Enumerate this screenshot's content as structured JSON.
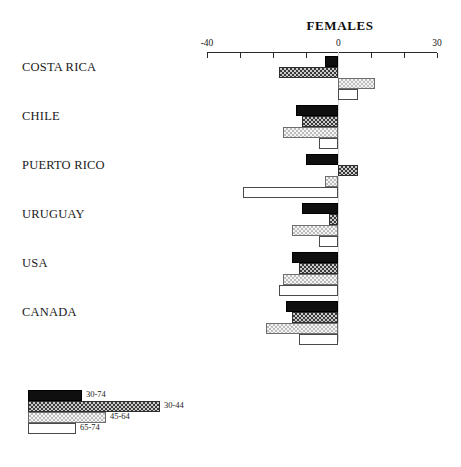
{
  "chart_data": {
    "type": "bar",
    "orientation": "horizontal",
    "title": "FEMALES",
    "xlabel": "",
    "ylabel": "",
    "xlim": [
      -40,
      30
    ],
    "xticks": [
      -40,
      -30,
      -20,
      -10,
      0,
      10,
      20,
      30
    ],
    "xtick_labels_shown": [
      "-40",
      "0",
      "30"
    ],
    "grid": false,
    "legend_position": "bottom-left",
    "categories": [
      "COSTA RICA",
      "CHILE",
      "PUERTO RICO",
      "URUGUAY",
      "USA",
      "CANADA"
    ],
    "series": [
      {
        "name": "30-74",
        "values": [
          -4,
          -13,
          -10,
          -11,
          -14,
          -16
        ]
      },
      {
        "name": "30-44",
        "values": [
          -18,
          -11,
          6,
          -3,
          -12,
          -14
        ]
      },
      {
        "name": "45-64",
        "values": [
          11,
          -17,
          -4,
          -14,
          -17,
          -22
        ]
      },
      {
        "name": "65-74",
        "values": [
          6,
          -6,
          -29,
          -6,
          -18,
          -12
        ]
      }
    ]
  },
  "title": "FEMALES",
  "axis": {
    "labels": [
      {
        "value": "-40",
        "at": -40
      },
      {
        "value": "0",
        "at": 0
      },
      {
        "value": "30",
        "at": 30
      }
    ]
  },
  "legend": {
    "items": [
      {
        "label": "30-74",
        "pattern": "solid-black",
        "swatch_width": 54
      },
      {
        "label": "30-44",
        "pattern": "dark-checker",
        "swatch_width": 132
      },
      {
        "label": "45-64",
        "pattern": "light-checker",
        "swatch_width": 78
      },
      {
        "label": "65-74",
        "pattern": "white-outline",
        "swatch_width": 48
      }
    ]
  }
}
